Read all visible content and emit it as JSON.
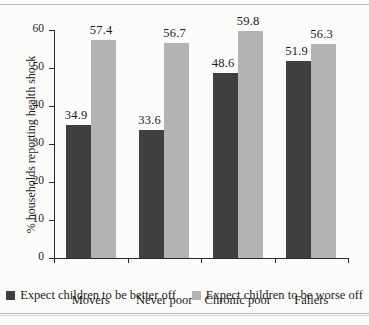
{
  "chart_data": {
    "type": "bar",
    "title": "",
    "xlabel": "",
    "ylabel": "% households reporting health shock",
    "ylim": [
      0,
      60
    ],
    "yticks": [
      0,
      10,
      20,
      30,
      40,
      50,
      60
    ],
    "grid": false,
    "legend_position": "bottom",
    "categories": [
      "Movers",
      "Never poor",
      "Chronic poor",
      "Fallers"
    ],
    "series": [
      {
        "name": "Expect children to be better off",
        "color": "#3f3f3f",
        "values": [
          34.9,
          33.6,
          48.6,
          51.9
        ],
        "labels": [
          "34.9",
          "33.6",
          "48.6",
          "51.9"
        ]
      },
      {
        "name": "Expect children to be worse off",
        "color": "#b3b3b3",
        "values": [
          57.4,
          56.7,
          59.8,
          56.3
        ],
        "labels": [
          "57.4",
          "56.7",
          "59.8",
          "56.3"
        ]
      }
    ]
  },
  "axis": {
    "y_tick_labels": [
      "0",
      "10",
      "20",
      "30",
      "40",
      "50",
      "60"
    ],
    "y_title": "% households reporting health shock"
  },
  "legend": {
    "items": [
      {
        "label": "Expect children to be better off",
        "color": "#3f3f3f"
      },
      {
        "label": "Expect children to be worse off",
        "color": "#b3b3b3"
      }
    ]
  }
}
